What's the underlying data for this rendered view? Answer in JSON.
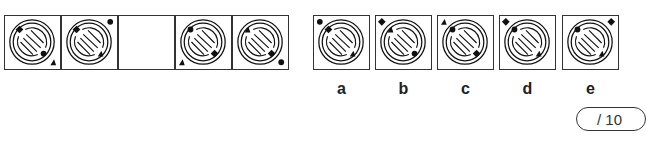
{
  "sequence": [
    {
      "inner_ul": "diamond",
      "inner_lr": "circle",
      "corner": "br",
      "corner_shape": "triangle"
    },
    {
      "inner_ul": "diamond",
      "inner_lr": "triangle",
      "corner": "tr",
      "corner_shape": "circle"
    },
    {
      "empty": true
    },
    {
      "inner_ul": "circle",
      "inner_lr": "diamond",
      "corner": "bl",
      "corner_shape": "triangle"
    },
    {
      "inner_ul": "triangle",
      "inner_lr": "diamond",
      "corner": "br",
      "corner_shape": "circle"
    }
  ],
  "options": [
    {
      "label": "a",
      "inner_ul": "diamond",
      "inner_lr": "triangle",
      "corner": "tl",
      "corner_shape": "circle"
    },
    {
      "label": "b",
      "inner_ul": "triangle",
      "inner_lr": "circle",
      "corner": "tl",
      "corner_shape": "diamond"
    },
    {
      "label": "c",
      "inner_ul": "circle",
      "inner_lr": "diamond",
      "corner": "tl",
      "corner_shape": "triangle"
    },
    {
      "label": "d",
      "inner_ul": "circle",
      "inner_lr": "triangle",
      "corner": "tl",
      "corner_shape": "diamond"
    },
    {
      "label": "e",
      "inner_ul": "circle",
      "inner_lr": "triangle",
      "corner": "tr",
      "corner_shape": "diamond"
    }
  ],
  "score": {
    "text": "/ 10"
  }
}
